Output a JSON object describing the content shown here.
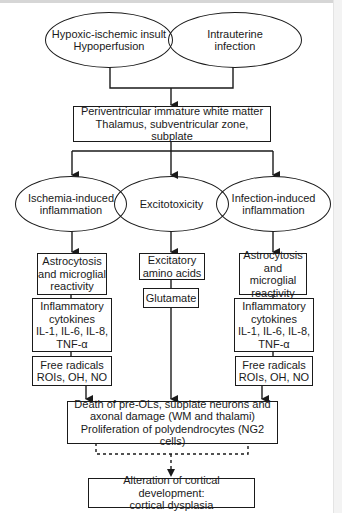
{
  "diagram": {
    "causes": [
      {
        "id": "hypoxic",
        "label": "Hypoxic-ischemic insult\nHypoperfusion"
      },
      {
        "id": "infection",
        "label": "Intrauterine\ninfection"
      }
    ],
    "target_region": {
      "label": "Periventricular immature white matter\nThalamus, subventricular zone, subplate"
    },
    "mechanisms": [
      {
        "id": "ischemia-inflammation",
        "label": "Ischemia-induced\ninflammation"
      },
      {
        "id": "excitotoxicity",
        "label": "Excitotoxicity"
      },
      {
        "id": "infection-inflammation",
        "label": "Infection-induced\ninflammation"
      }
    ],
    "left_column": [
      {
        "label": "Astrocytosis\nand microglial\nreactivity"
      },
      {
        "label": "Inflammatory\ncytokines\nIL-1, IL-6, IL-8,\nTNF-α"
      },
      {
        "label": "Free radicals\nROIs, OH, NO"
      }
    ],
    "middle_column": [
      {
        "label": "Excitatory\namino acids"
      },
      {
        "label": "Glutamate"
      }
    ],
    "right_column": [
      {
        "label": "Astrocytosis\nand microglial\nreactivity"
      },
      {
        "label": "Inflammatory\ncytokines\nIL-1, IL-6, IL-8,\nTNF-α"
      },
      {
        "label": "Free radicals\nROIs, OH, NO"
      }
    ],
    "outcome": {
      "label": "Death of pre-OLs, subplate neurons and\naxonal damage (WM and thalami)\nProliferation of polydendrocytes (NG2 cells)"
    },
    "final_outcome": {
      "label": "Alteration of cortical development:\ncortical dysplasia"
    },
    "colors": {
      "line": "#1a1a1a",
      "background": "#ffffff"
    }
  }
}
